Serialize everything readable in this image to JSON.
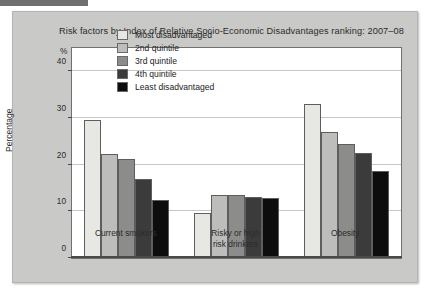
{
  "figure": {
    "title": "Risk factors by Index of Relative Socio-Economic Disadvantages ranking: 2007–08",
    "unit_label": "%",
    "y_axis_title": "Percentage"
  },
  "chart_data": {
    "type": "bar",
    "title": "Risk factors by Index of Relative Socio-Economic Disadvantages ranking: 2007–08",
    "xlabel": "",
    "ylabel": "Percentage",
    "unit": "%",
    "ylim": [
      0,
      45
    ],
    "yticks": [
      0,
      10,
      20,
      30,
      40
    ],
    "ytick_labels": [
      "0",
      "10",
      "20",
      "30",
      "40"
    ],
    "grid": true,
    "legend_position": "top-center-inside",
    "categories": [
      "Current smokers",
      "Risky or high\nrisk drinkers",
      "Obesity"
    ],
    "series": [
      {
        "name": "Most disadvantaged",
        "color": "#e7e7e4",
        "values": [
          29.6,
          9.6,
          33.0
        ]
      },
      {
        "name": "2nd quintile",
        "color": "#bdbdbb",
        "values": [
          22.3,
          13.5,
          27.0
        ]
      },
      {
        "name": "3rd quintile",
        "color": "#8c8c8a",
        "values": [
          21.2,
          13.5,
          24.4
        ]
      },
      {
        "name": "4th quintile",
        "color": "#3b3b3b",
        "values": [
          17.0,
          13.1,
          22.4
        ]
      },
      {
        "name": "Least disadvantaged",
        "color": "#0d0d0d",
        "values": [
          12.5,
          12.9,
          18.6
        ]
      }
    ]
  },
  "legend": {
    "items": [
      {
        "label": "Most disadvantaged"
      },
      {
        "label": "2nd quintile"
      },
      {
        "label": "3rd quintile"
      },
      {
        "label": "4th quintile"
      },
      {
        "label": "Least disadvantaged"
      }
    ]
  }
}
